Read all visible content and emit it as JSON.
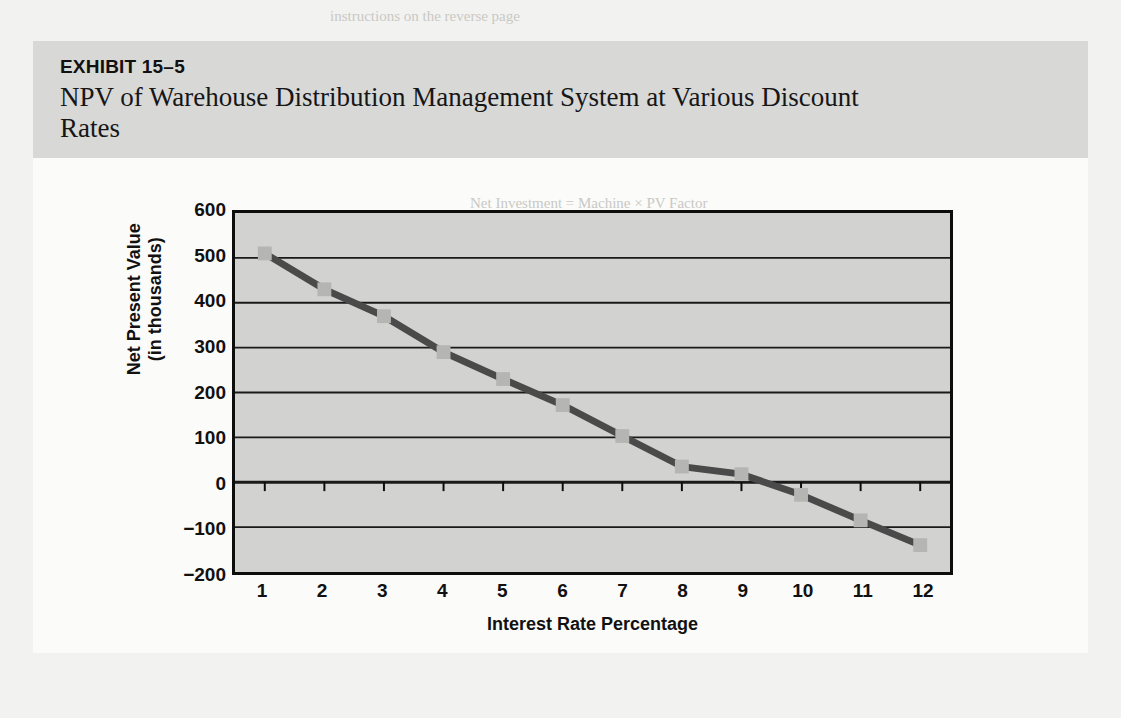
{
  "exhibit": {
    "number": "EXHIBIT 15–5",
    "title": "NPV of Warehouse Distribution Management System at Various Discount Rates"
  },
  "colors": {
    "page_background": "#f2f2f0",
    "card_background": "#fbfbfa",
    "header_band": "#d8d8d6",
    "plot_background": "#d2d2d0",
    "axis": "#0d0d0d",
    "gridline": "#1a1a1a",
    "line_series": "#4a4a4a",
    "marker_fill": "#b5b5b3"
  },
  "chart_data": {
    "type": "line",
    "title": "NPV of Warehouse Distribution Management System at Various Discount Rates",
    "xlabel": "Interest Rate Percentage",
    "ylabel": "Net Present Value (in thousands)",
    "ylabel_line1": "Net Present Value",
    "ylabel_line2": "(in thousands)",
    "x": [
      1,
      2,
      3,
      4,
      5,
      6,
      7,
      8,
      9,
      10,
      11,
      12
    ],
    "xtick_labels": [
      "1",
      "2",
      "3",
      "4",
      "5",
      "6",
      "7",
      "8",
      "9",
      "10",
      "11",
      "12"
    ],
    "values": [
      510,
      430,
      370,
      290,
      230,
      172,
      103,
      35,
      18,
      -28,
      -85,
      -140
    ],
    "ytick_labels": [
      "600",
      "500",
      "400",
      "300",
      "200",
      "100",
      "0",
      "−100",
      "−200"
    ],
    "yticks": [
      600,
      500,
      400,
      300,
      200,
      100,
      0,
      -100,
      -200
    ],
    "ylim": [
      -200,
      600
    ],
    "xlim": [
      0.5,
      12.5
    ],
    "grid": true,
    "grid_axis": "y",
    "legend": "none",
    "markers": "square"
  },
  "bleed_text": {
    "top_right": "instructions on the reverse page",
    "mid_right": "Net Investment = Machine × PV Factor"
  }
}
